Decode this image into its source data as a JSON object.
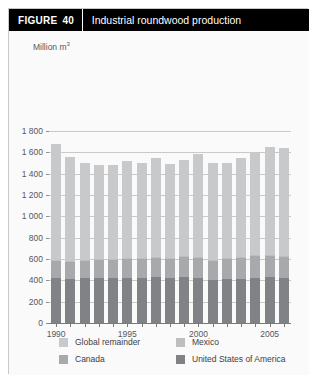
{
  "figure": {
    "tag": "FIGURE",
    "number": "40",
    "title": "Industrial roundwood production"
  },
  "chart_data": {
    "type": "bar",
    "stacked": true,
    "title": "Industrial roundwood production",
    "xlabel": "",
    "ylabel": "Million m³",
    "ylim": [
      0,
      1800
    ],
    "ytick_step": 200,
    "yticks": [
      "0",
      "200",
      "400",
      "600",
      "800",
      "1 000",
      "1 200",
      "1 400",
      "1 600",
      "1 800"
    ],
    "grid": true,
    "legend_position": "bottom",
    "categories": [
      "1990",
      "1991",
      "1992",
      "1993",
      "1994",
      "1995",
      "1996",
      "1997",
      "1998",
      "1999",
      "2000",
      "2001",
      "2002",
      "2003",
      "2004",
      "2005",
      "2006"
    ],
    "xtick_labels": [
      "1990",
      "1995",
      "2000",
      "2005"
    ],
    "xtick_label_years": [
      1990,
      1995,
      2000,
      2005
    ],
    "series": [
      {
        "name": "United States of America",
        "color": "#808285",
        "values": [
          425,
          415,
          420,
          420,
          420,
          425,
          425,
          430,
          425,
          430,
          420,
          405,
          415,
          415,
          425,
          430,
          425
        ]
      },
      {
        "name": "Canada",
        "color": "#a7a9ac",
        "values": [
          160,
          160,
          160,
          170,
          175,
          180,
          180,
          185,
          180,
          190,
          195,
          180,
          190,
          195,
          205,
          205,
          195
        ]
      },
      {
        "name": "Mexico",
        "color": "#bcbec0",
        "values": [
          10,
          9,
          8,
          7,
          7,
          7,
          7,
          8,
          8,
          8,
          8,
          7,
          6,
          6,
          6,
          7,
          7
        ]
      },
      {
        "name": "Global remainder",
        "color": "#c7c9cb",
        "values": [
          1085,
          975,
          912,
          883,
          878,
          908,
          888,
          927,
          877,
          902,
          957,
          908,
          889,
          934,
          964,
          1008,
          1013
        ]
      }
    ],
    "totals": [
      1680,
      1559,
      1500,
      1480,
      1480,
      1520,
      1500,
      1550,
      1490,
      1530,
      1580,
      1500,
      1500,
      1550,
      1600,
      1650,
      1640
    ],
    "legend_entries": [
      {
        "label": "Global remainder",
        "color": "#c7c9cb"
      },
      {
        "label": "Mexico",
        "color": "#bcbec0"
      },
      {
        "label": "Canada",
        "color": "#a7a9ac"
      },
      {
        "label": "United States of America",
        "color": "#808285"
      }
    ]
  },
  "legend": {
    "global_remainder": "Global remainder",
    "mexico": "Mexico",
    "canada": "Canada",
    "usa": "United States of America"
  }
}
